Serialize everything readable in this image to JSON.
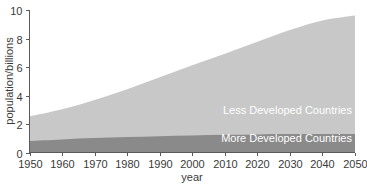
{
  "chart_data": {
    "type": "area",
    "title": "",
    "xlabel": "year",
    "ylabel": "population/billions",
    "xlim": [
      1950,
      2050
    ],
    "ylim": [
      0,
      10
    ],
    "grid": false,
    "legend_position": "inside-right",
    "stacked": true,
    "x": [
      1950,
      1960,
      1970,
      1980,
      1990,
      2000,
      2010,
      2020,
      2030,
      2040,
      2050
    ],
    "xticks": [
      "1950",
      "1960",
      "1970",
      "1980",
      "1990",
      "2000",
      "2010",
      "2020",
      "2030",
      "2040",
      "2050"
    ],
    "yticks": [
      "0",
      "2",
      "4",
      "6",
      "8",
      "10"
    ],
    "series": [
      {
        "name": "More Developed Countries",
        "color": "#8a8a8a",
        "values": [
          0.81,
          0.92,
          1.01,
          1.08,
          1.14,
          1.19,
          1.24,
          1.27,
          1.29,
          1.3,
          1.3
        ]
      },
      {
        "name": "Less Developed Countries",
        "color": "#c8c8c8",
        "values": [
          1.72,
          2.11,
          2.68,
          3.36,
          4.14,
          4.93,
          5.69,
          6.5,
          7.3,
          7.96,
          8.31
        ]
      }
    ],
    "totals": [
      2.53,
      3.03,
      3.69,
      4.44,
      5.28,
      6.12,
      6.93,
      7.77,
      8.59,
      9.26,
      9.61
    ],
    "annotations": [
      {
        "text": "Less Developed Countries",
        "x": 2043,
        "y": 4.4
      },
      {
        "text": "More Developed Countries",
        "x": 2043,
        "y": 0.65
      }
    ]
  },
  "colors": {
    "less_developed": "#c8c8c8",
    "more_developed": "#8a8a8a",
    "axis": "#5a5a5a",
    "text": "#3a3a3a",
    "label_text": "#ffffff",
    "background": "#ffffff"
  }
}
